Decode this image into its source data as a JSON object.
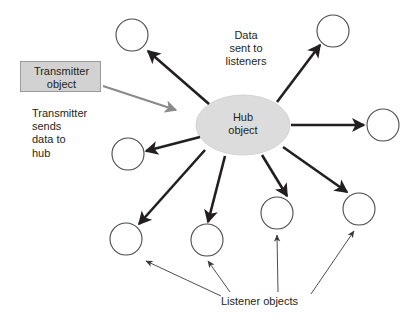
{
  "diagram": {
    "colors": {
      "stroke_dark": "#231f20",
      "arrow_gray": "#8a8a8a",
      "hub_fill": "#dcdcdc",
      "hub_stroke": "#cfcfcf",
      "box_fill": "#d2d2d2",
      "box_stroke": "#9a9a9a",
      "circle_stroke": "#4a4a4a",
      "background": "#ffffff"
    },
    "transmitter_box": {
      "label": "Transmitter\nobject"
    },
    "notes": {
      "transmitter_note": "Transmitter\nsends\ndata to\nhub",
      "data_sent_note": "Data\nsent to\nlisteners",
      "listener_objects": "Listener objects"
    },
    "hub": {
      "label": "Hub\nobject",
      "cx": 243,
      "cy": 125,
      "rx": 47,
      "ry": 30
    },
    "listener_circles": [
      {
        "name": "listener-top-left",
        "cx": 132,
        "cy": 35,
        "r": 16
      },
      {
        "name": "listener-top-right",
        "cx": 333,
        "cy": 31,
        "r": 16
      },
      {
        "name": "listener-right",
        "cx": 383,
        "cy": 125,
        "r": 16
      },
      {
        "name": "listener-left",
        "cx": 128,
        "cy": 154,
        "r": 16
      },
      {
        "name": "listener-bottom-left",
        "cx": 126,
        "cy": 239,
        "r": 16
      },
      {
        "name": "listener-bottom-mid",
        "cx": 207,
        "cy": 240,
        "r": 16
      },
      {
        "name": "listener-bottom-right",
        "cx": 277,
        "cy": 213,
        "r": 16
      },
      {
        "name": "listener-far-right",
        "cx": 359,
        "cy": 209,
        "r": 16
      }
    ],
    "hub_arrows": [
      {
        "name": "arrow-hub-to-top-left",
        "x1": 209,
        "y1": 104,
        "x2": 148,
        "y2": 51
      },
      {
        "name": "arrow-hub-to-top-right",
        "x1": 277,
        "y1": 102,
        "x2": 320,
        "y2": 45
      },
      {
        "name": "arrow-hub-to-right",
        "x1": 291,
        "y1": 125,
        "x2": 365,
        "y2": 125
      },
      {
        "name": "arrow-hub-to-left",
        "x1": 200,
        "y1": 137,
        "x2": 145,
        "y2": 151
      },
      {
        "name": "arrow-hub-to-bottom-left",
        "x1": 205,
        "y1": 150,
        "x2": 139,
        "y2": 224
      },
      {
        "name": "arrow-hub-to-bottom-mid",
        "x1": 225,
        "y1": 156,
        "x2": 208,
        "y2": 223
      },
      {
        "name": "arrow-hub-to-bottom-right",
        "x1": 263,
        "y1": 155,
        "x2": 287,
        "y2": 196
      },
      {
        "name": "arrow-hub-to-far-right",
        "x1": 283,
        "y1": 147,
        "x2": 347,
        "y2": 192
      }
    ],
    "transmitter_arrow": {
      "name": "arrow-transmitter-to-hub",
      "x1": 103,
      "y1": 86,
      "x2": 177,
      "y2": 111
    },
    "callout_arrows": [
      {
        "name": "callout-to-bottom-left",
        "x1": 221,
        "y1": 296,
        "x2": 145,
        "y2": 260
      },
      {
        "name": "callout-to-bottom-mid",
        "x1": 230,
        "y1": 292,
        "x2": 207,
        "y2": 261
      },
      {
        "name": "callout-to-bottom-right",
        "x1": 278,
        "y1": 292,
        "x2": 277,
        "y2": 234
      },
      {
        "name": "callout-to-far-right",
        "x1": 311,
        "y1": 294,
        "x2": 355,
        "y2": 230
      }
    ]
  }
}
